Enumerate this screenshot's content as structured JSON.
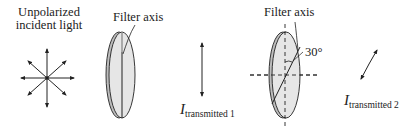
{
  "incident": {
    "label_line1": "Unpolarized",
    "label_line2": "incident light"
  },
  "filter1": {
    "label": "Filter axis",
    "axis_orientation": "vertical"
  },
  "transmitted1": {
    "symbol": "I",
    "subscript": "transmitted 1",
    "polarization": "vertical"
  },
  "filter2": {
    "label": "Filter axis",
    "angle_label": "30°",
    "axis_angle_from_vertical_deg": 30
  },
  "transmitted2": {
    "symbol": "I",
    "subscript": "transmitted 2",
    "polarization": "tilted 30°"
  },
  "colors": {
    "lens_fill": "#e6e6e6",
    "lens_edge": "#aaaaaa",
    "stroke": "#222222"
  }
}
